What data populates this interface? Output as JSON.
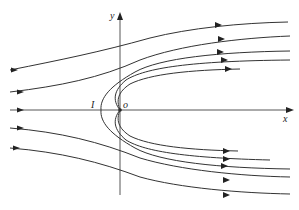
{
  "diagram": {
    "type": "streamline flow field around a half-body (source in uniform flow)",
    "axes": {
      "x_label": "x",
      "y_label": "y",
      "origin_label": "o",
      "point_label": "I"
    },
    "colors": {
      "line": "#333333",
      "background": "#ffffff"
    },
    "streamlines": {
      "incoming_from_left_above": 2,
      "incoming_along_axis": 1,
      "incoming_from_left_below": 2,
      "body_contour_and_inner_lines_upper": 3,
      "body_contour_and_inner_lines_lower": 3
    }
  }
}
